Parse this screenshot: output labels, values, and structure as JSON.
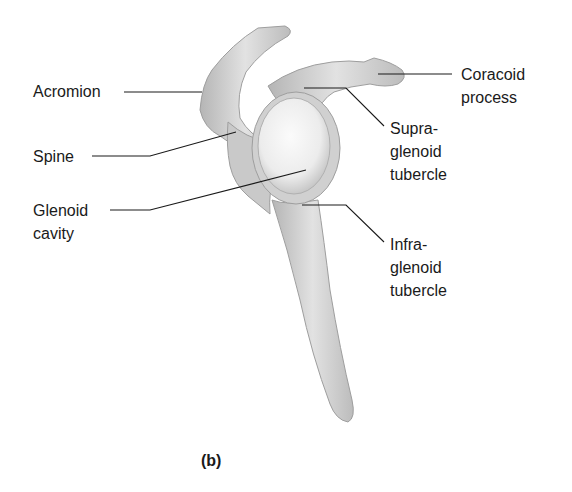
{
  "figure": {
    "panel_label": "(b)",
    "colors": {
      "background": "#ffffff",
      "bone": "#d9d9d9",
      "bone_shadow": "#a8a8a8",
      "glenoid_highlight": "#f4f4f4",
      "leader_line": "#1a1a1a",
      "text": "#1a1a1a"
    }
  },
  "labels": {
    "acromion": {
      "text": "Acromion"
    },
    "spine": {
      "text": "Spine"
    },
    "glenoid_cavity": {
      "line1": "Glenoid",
      "line2": "cavity"
    },
    "coracoid_process": {
      "line1": "Coracoid",
      "line2": "process"
    },
    "supraglenoid_tubercle": {
      "line1": "Supra-",
      "line2": "glenoid",
      "line3": "tubercle"
    },
    "infraglenoid_tubercle": {
      "line1": "Infra-",
      "line2": "glenoid",
      "line3": "tubercle"
    }
  }
}
